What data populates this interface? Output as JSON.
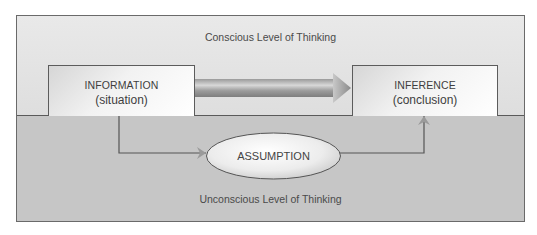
{
  "diagram": {
    "conscious_label": "Conscious Level of Thinking",
    "unconscious_label": "Unconscious Level of Thinking",
    "information_box": {
      "title": "INFORMATION",
      "subtitle": "(situation)"
    },
    "inference_box": {
      "title": "INFERENCE",
      "subtitle": "(conclusion)"
    },
    "assumption_node": {
      "label": "ASSUMPTION"
    },
    "edges": [
      {
        "from": "INFORMATION",
        "to": "INFERENCE",
        "style": "thick-gradient-arrow"
      },
      {
        "from": "INFORMATION",
        "to": "ASSUMPTION",
        "style": "thin-elbow-arrow"
      },
      {
        "from": "ASSUMPTION",
        "to": "INFERENCE",
        "style": "thin-elbow-arrow"
      }
    ],
    "colors": {
      "conscious_bg": "#e4e4e4",
      "unconscious_bg": "#c6c6c6",
      "border": "#5c5c5c",
      "text": "#444444"
    }
  }
}
